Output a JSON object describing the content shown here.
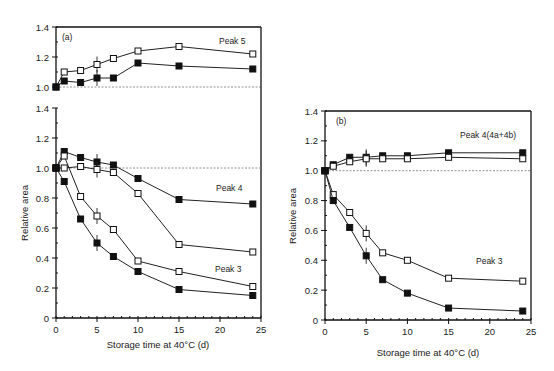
{
  "chart_data": [
    {
      "panel": "(a)",
      "type": "line",
      "xlabel": "Storage time at 40°C (d)",
      "ylabel": "Relative area",
      "xlim": [
        0,
        25
      ],
      "xticks": [
        "0",
        "5",
        "10",
        "15",
        "20",
        "25"
      ],
      "subplots": [
        {
          "annotation": "Peak 5",
          "ylim": [
            1.0,
            1.4
          ],
          "yticks": [
            "1.0",
            "1.2",
            "1.4"
          ],
          "series": [
            {
              "name": "Peak 5 open",
              "marker": "open-square",
              "x": [
                0,
                1,
                3,
                5,
                7,
                10,
                15,
                24
              ],
              "y": [
                1.0,
                1.1,
                1.11,
                1.15,
                1.19,
                1.24,
                1.27,
                1.22
              ]
            },
            {
              "name": "Peak 5 filled",
              "marker": "filled-square",
              "x": [
                0,
                1,
                3,
                5,
                7,
                10,
                15,
                24
              ],
              "y": [
                1.0,
                1.04,
                1.03,
                1.06,
                1.06,
                1.16,
                1.14,
                1.12
              ]
            }
          ]
        },
        {
          "annotations": [
            "Peak 4",
            "Peak 3"
          ],
          "ylim": [
            0,
            1.4
          ],
          "yticks": [
            "0",
            "0.2",
            "0.4",
            "0.6",
            "0.8",
            "1.0",
            "1.2",
            "1.4"
          ],
          "series": [
            {
              "name": "Peak 4 filled",
              "marker": "filled-square",
              "x": [
                0,
                1,
                3,
                5,
                7,
                10,
                15,
                24
              ],
              "y": [
                1.0,
                1.11,
                1.07,
                1.04,
                1.02,
                0.93,
                0.79,
                0.76
              ]
            },
            {
              "name": "Peak 4 open",
              "marker": "open-square",
              "x": [
                0,
                1,
                3,
                5,
                7,
                10,
                15,
                24
              ],
              "y": [
                1.0,
                1.0,
                1.01,
                0.99,
                0.97,
                0.83,
                0.49,
                0.44
              ]
            },
            {
              "name": "Peak 3 open",
              "marker": "open-square",
              "x": [
                0,
                1,
                3,
                5,
                7,
                10,
                15,
                24
              ],
              "y": [
                1.0,
                1.08,
                0.81,
                0.68,
                0.59,
                0.38,
                0.31,
                0.21
              ]
            },
            {
              "name": "Peak 3 filled",
              "marker": "filled-square",
              "x": [
                0,
                1,
                3,
                5,
                7,
                10,
                15,
                24
              ],
              "y": [
                1.0,
                0.91,
                0.66,
                0.5,
                0.41,
                0.31,
                0.19,
                0.15
              ]
            }
          ]
        }
      ]
    },
    {
      "panel": "(b)",
      "type": "line",
      "xlabel": "Storage time at 40°C (d)",
      "ylabel": "Relative area",
      "xlim": [
        0,
        25
      ],
      "ylim": [
        0,
        1.4
      ],
      "xticks": [
        "0",
        "5",
        "10",
        "15",
        "20",
        "25"
      ],
      "yticks": [
        "0",
        "0.2",
        "0.4",
        "0.6",
        "0.8",
        "1.0",
        "1.2",
        "1.4"
      ],
      "annotations": [
        "Peak 4(4a+4b)",
        "Peak 3"
      ],
      "series": [
        {
          "name": "Peak 4 filled",
          "marker": "filled-square",
          "x": [
            0,
            1,
            3,
            5,
            7,
            10,
            15,
            24
          ],
          "y": [
            1.0,
            1.04,
            1.09,
            1.09,
            1.1,
            1.1,
            1.12,
            1.12
          ]
        },
        {
          "name": "Peak 4 open",
          "marker": "open-square",
          "x": [
            0,
            1,
            3,
            5,
            7,
            10,
            15,
            24
          ],
          "y": [
            1.0,
            1.03,
            1.06,
            1.08,
            1.08,
            1.08,
            1.09,
            1.08
          ]
        },
        {
          "name": "Peak 3 open",
          "marker": "open-square",
          "x": [
            0,
            1,
            3,
            5,
            7,
            10,
            15,
            24
          ],
          "y": [
            1.0,
            0.84,
            0.72,
            0.58,
            0.45,
            0.4,
            0.28,
            0.26
          ]
        },
        {
          "name": "Peak 3 filled",
          "marker": "filled-square",
          "x": [
            0,
            1,
            3,
            5,
            7,
            10,
            15,
            24
          ],
          "y": [
            1.0,
            0.8,
            0.62,
            0.43,
            0.27,
            0.18,
            0.08,
            0.06
          ]
        }
      ]
    }
  ],
  "labels": {
    "panel_a": "(a)",
    "panel_b": "(b)",
    "peak5": "Peak 5",
    "peak4": "Peak 4",
    "peak3a": "Peak 3",
    "peak4b": "Peak 4(4a+4b)",
    "peak3b": "Peak 3",
    "xlabel": "Storage time at 40°C (d)",
    "ylabel": "Relative area"
  }
}
